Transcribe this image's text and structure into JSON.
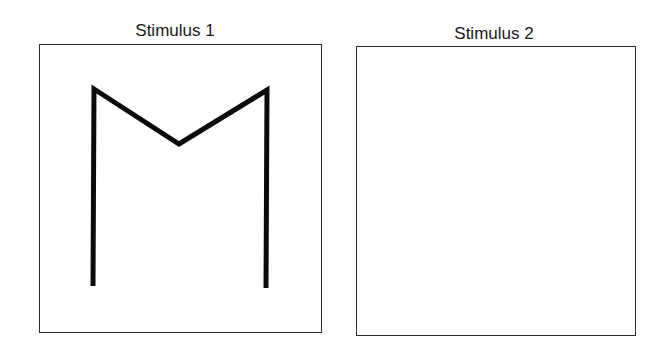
{
  "panels": [
    {
      "label": "Stimulus 1",
      "label_center_x": 175,
      "label_top": 21,
      "box": {
        "left": 39,
        "top": 44,
        "width": 283,
        "height": 289
      },
      "content": "M-shaped line figure"
    },
    {
      "label": "Stimulus 2",
      "label_center_x": 494,
      "label_top": 24,
      "box": {
        "left": 356,
        "top": 46,
        "width": 280,
        "height": 290
      },
      "content": "empty"
    }
  ],
  "figure": {
    "stroke_color": "#0a0a0a",
    "stroke_width": 5,
    "points": "93,286 94,89 179,144 267,90 266,288"
  }
}
